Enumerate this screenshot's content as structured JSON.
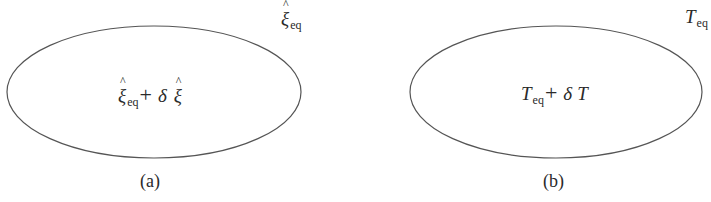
{
  "diagram": {
    "panels": [
      {
        "id": "a",
        "caption": "(a)",
        "outside_label": {
          "symbol": "ξ",
          "accent": "^",
          "subscript": "eq"
        },
        "inside_label": {
          "term1_symbol": "ξ",
          "term1_subscript": "eq",
          "operator": "+",
          "delta": "δ",
          "term2_symbol": "ξ"
        },
        "ellipse": {
          "cx": 154,
          "cy": 92,
          "rx": 147,
          "ry": 66,
          "stroke": "#555555"
        }
      },
      {
        "id": "b",
        "caption": "(b)",
        "outside_label": {
          "symbol": "T",
          "subscript": "eq"
        },
        "inside_label": {
          "term1_symbol": "T",
          "term1_subscript": "eq",
          "operator": "+",
          "delta": "δ",
          "term2_symbol": "T"
        },
        "ellipse": {
          "cx": 556,
          "cy": 92,
          "rx": 146,
          "ry": 66,
          "stroke": "#555555"
        }
      }
    ]
  }
}
